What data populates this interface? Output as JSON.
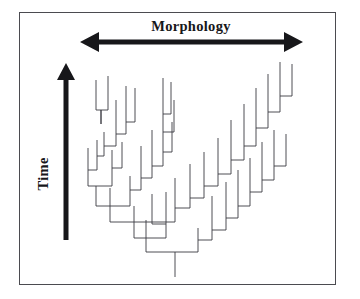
{
  "figure": {
    "kind": "phylogenetic-tree-diagram",
    "background_color": "#ffffff",
    "frame": {
      "color": "#4b4b50",
      "x": 19,
      "y": 12,
      "width": 317,
      "height": 273,
      "stroke_width": 1.6
    }
  },
  "axes": {
    "horizontal": {
      "label": "Morphology",
      "arrow_style": "double-headed",
      "color": "#17171a",
      "x_start": 80,
      "x_end": 303,
      "y": 42,
      "shaft_thickness": 5,
      "head_length": 19,
      "head_halfwidth": 10,
      "label_x": 191,
      "label_y": 19,
      "label_font_size": 14.5,
      "label_bold": true
    },
    "vertical": {
      "label": "Time",
      "arrow_style": "single-headed-up",
      "color": "#17171a",
      "x": 66,
      "y_bottom": 240,
      "y_top": 63,
      "shaft_thickness": 5,
      "head_length": 17,
      "head_halfwidth": 9,
      "label_x": 50,
      "label_y": 176,
      "label_rotation_deg": -90,
      "label_font_size": 14.5,
      "label_bold": true
    }
  },
  "chart_data": {
    "type": "line",
    "title": "Morphology",
    "xlabel": "Morphology",
    "ylabel": "Time",
    "grid": false,
    "legend": null,
    "root": {
      "x": 175,
      "y": 277
    },
    "tip_count": 46,
    "line_color": "#3a3a42",
    "line_width": 0.9,
    "segments": [
      [
        175,
        277,
        175,
        252
      ],
      [
        146,
        252,
        198,
        252
      ],
      [
        146,
        252,
        146,
        238
      ],
      [
        198,
        252,
        198,
        240
      ],
      [
        134,
        238,
        166,
        238
      ],
      [
        134,
        238,
        134,
        222
      ],
      [
        166,
        238,
        166,
        224
      ],
      [
        110,
        222,
        175,
        222
      ],
      [
        110,
        222,
        110,
        206
      ],
      [
        175,
        222,
        175,
        208
      ],
      [
        96,
        206,
        130,
        206
      ],
      [
        96,
        206,
        96,
        186
      ],
      [
        130,
        206,
        130,
        190
      ],
      [
        88,
        186,
        112,
        186
      ],
      [
        88,
        186,
        88,
        170
      ],
      [
        112,
        186,
        112,
        168
      ],
      [
        88,
        170,
        88,
        148
      ],
      [
        97,
        170,
        97,
        156
      ],
      [
        88,
        170,
        97,
        170
      ],
      [
        97,
        156,
        97,
        140
      ],
      [
        104,
        156,
        104,
        146
      ],
      [
        97,
        156,
        104,
        156
      ],
      [
        104,
        146,
        104,
        132
      ],
      [
        116,
        146,
        116,
        134
      ],
      [
        104,
        146,
        116,
        146
      ],
      [
        116,
        134,
        116,
        120
      ],
      [
        126,
        134,
        126,
        122
      ],
      [
        116,
        134,
        126,
        134
      ],
      [
        126,
        122,
        126,
        104
      ],
      [
        135,
        122,
        135,
        108
      ],
      [
        126,
        122,
        135,
        122
      ],
      [
        112,
        168,
        112,
        150
      ],
      [
        112,
        168,
        122,
        168
      ],
      [
        122,
        168,
        122,
        156
      ],
      [
        101,
        124,
        101,
        110
      ],
      [
        96,
        110,
        96,
        95
      ],
      [
        108,
        110,
        108,
        92
      ],
      [
        96,
        110,
        108,
        110
      ],
      [
        101,
        124,
        101,
        110
      ],
      [
        130,
        190,
        130,
        176
      ],
      [
        141,
        190,
        141,
        178
      ],
      [
        130,
        190,
        141,
        190
      ],
      [
        141,
        178,
        141,
        164
      ],
      [
        152,
        178,
        152,
        166
      ],
      [
        141,
        178,
        152,
        178
      ],
      [
        152,
        166,
        152,
        150
      ],
      [
        163,
        166,
        163,
        152
      ],
      [
        152,
        166,
        163,
        166
      ],
      [
        163,
        152,
        163,
        132
      ],
      [
        172,
        152,
        172,
        140
      ],
      [
        163,
        152,
        172,
        152
      ],
      [
        163,
        132,
        163,
        114
      ],
      [
        174,
        132,
        174,
        118
      ],
      [
        163,
        132,
        174,
        132
      ],
      [
        163,
        114,
        163,
        96
      ],
      [
        171,
        114,
        171,
        100
      ],
      [
        163,
        114,
        171,
        114
      ],
      [
        175,
        208,
        175,
        196
      ],
      [
        190,
        208,
        190,
        198
      ],
      [
        175,
        208,
        190,
        208
      ],
      [
        190,
        198,
        190,
        182
      ],
      [
        204,
        198,
        204,
        186
      ],
      [
        190,
        198,
        204,
        198
      ],
      [
        204,
        186,
        204,
        170
      ],
      [
        218,
        186,
        218,
        174
      ],
      [
        204,
        186,
        218,
        186
      ],
      [
        218,
        174,
        218,
        158
      ],
      [
        231,
        174,
        231,
        160
      ],
      [
        218,
        174,
        231,
        174
      ],
      [
        231,
        160,
        231,
        140
      ],
      [
        244,
        160,
        244,
        146
      ],
      [
        231,
        160,
        244,
        160
      ],
      [
        244,
        146,
        244,
        124
      ],
      [
        256,
        146,
        256,
        128
      ],
      [
        244,
        146,
        256,
        146
      ],
      [
        256,
        128,
        256,
        108
      ],
      [
        268,
        128,
        268,
        112
      ],
      [
        256,
        128,
        268,
        128
      ],
      [
        268,
        112,
        268,
        92
      ],
      [
        280,
        112,
        280,
        96
      ],
      [
        268,
        112,
        280,
        112
      ],
      [
        280,
        96,
        280,
        78
      ],
      [
        292,
        96,
        292,
        80
      ],
      [
        280,
        96,
        292,
        96
      ],
      [
        198,
        240,
        198,
        228
      ],
      [
        212,
        240,
        212,
        230
      ],
      [
        198,
        240,
        212,
        240
      ],
      [
        212,
        230,
        212,
        214
      ],
      [
        226,
        230,
        226,
        218
      ],
      [
        212,
        230,
        226,
        230
      ],
      [
        226,
        218,
        226,
        200
      ],
      [
        238,
        218,
        238,
        206
      ],
      [
        226,
        218,
        238,
        218
      ],
      [
        238,
        206,
        238,
        188
      ],
      [
        250,
        206,
        250,
        192
      ],
      [
        238,
        206,
        250,
        206
      ],
      [
        250,
        192,
        250,
        176
      ],
      [
        262,
        192,
        262,
        180
      ],
      [
        250,
        192,
        262,
        192
      ],
      [
        262,
        180,
        262,
        160
      ],
      [
        274,
        180,
        274,
        166
      ],
      [
        262,
        180,
        274,
        180
      ],
      [
        274,
        166,
        274,
        148
      ],
      [
        286,
        166,
        286,
        152
      ],
      [
        274,
        166,
        286,
        166
      ],
      [
        166,
        224,
        166,
        210
      ],
      [
        152,
        224,
        152,
        212
      ],
      [
        152,
        224,
        166,
        224
      ],
      [
        134,
        222,
        134,
        206
      ],
      [
        122,
        156,
        122,
        142
      ],
      [
        116,
        120,
        116,
        100
      ],
      [
        108,
        92,
        108,
        76
      ],
      [
        96,
        95,
        96,
        80
      ],
      [
        126,
        104,
        126,
        86
      ],
      [
        135,
        108,
        135,
        88
      ],
      [
        141,
        164,
        141,
        146
      ],
      [
        152,
        150,
        152,
        130
      ],
      [
        172,
        140,
        172,
        122
      ],
      [
        174,
        118,
        174,
        100
      ],
      [
        171,
        100,
        171,
        82
      ],
      [
        163,
        96,
        163,
        78
      ],
      [
        190,
        182,
        190,
        164
      ],
      [
        204,
        170,
        204,
        152
      ],
      [
        218,
        158,
        218,
        138
      ],
      [
        231,
        140,
        231,
        120
      ],
      [
        244,
        124,
        244,
        104
      ],
      [
        256,
        108,
        256,
        88
      ],
      [
        268,
        92,
        268,
        74
      ],
      [
        280,
        78,
        280,
        62
      ],
      [
        292,
        80,
        292,
        64
      ],
      [
        212,
        214,
        212,
        196
      ],
      [
        226,
        200,
        226,
        182
      ],
      [
        238,
        188,
        238,
        170
      ],
      [
        250,
        176,
        250,
        158
      ],
      [
        262,
        160,
        262,
        142
      ],
      [
        274,
        148,
        274,
        130
      ],
      [
        286,
        152,
        286,
        134
      ],
      [
        166,
        210,
        166,
        192
      ],
      [
        152,
        212,
        152,
        194
      ],
      [
        110,
        206,
        110,
        188
      ],
      [
        175,
        196,
        175,
        178
      ],
      [
        146,
        238,
        146,
        220
      ]
    ]
  }
}
